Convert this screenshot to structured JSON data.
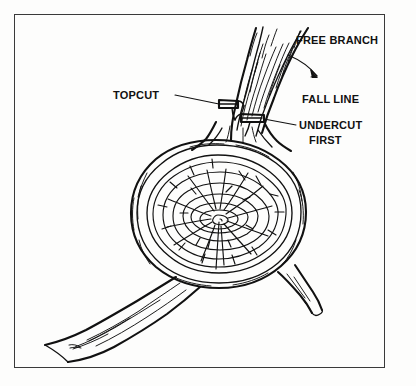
{
  "figure": {
    "kind": "line-drawing",
    "background_color": "#fdfdfc",
    "ink_color": "#111111",
    "frame": {
      "name": "border-frame",
      "color": "#3a3a3a",
      "x": 14,
      "y": 14,
      "width": 371,
      "height": 354
    }
  },
  "labels": {
    "free_branch": "FREE BRANCH",
    "fall_line": "FALL LINE",
    "topcut": "TOPCUT",
    "undercut_line1": "UNDERCUT",
    "undercut_line2": "FIRST"
  },
  "parts": {
    "branch": "free-branch",
    "log": "log-cross-section",
    "topcut_notch": "topcut-notch",
    "undercut_notch": "undercut-notch",
    "lower_limb": "lower-left-limb",
    "right_stub": "right-branch-stub",
    "pith": "pith-center",
    "fall_arrow": "fall-line-arrow"
  }
}
